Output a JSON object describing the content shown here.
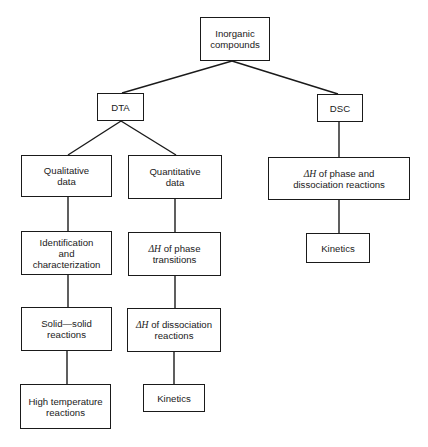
{
  "diagram": {
    "type": "tree",
    "root": {
      "id": "inorganic",
      "label": "Inorganic\ncompounds"
    },
    "nodes": [
      {
        "id": "inorganic",
        "label": "Inorganic\ncompounds",
        "box": [
          200,
          17,
          70,
          44
        ]
      },
      {
        "id": "dta",
        "label": "DTA",
        "box": [
          97,
          93,
          47,
          28
        ]
      },
      {
        "id": "dsc",
        "label": "DSC",
        "box": [
          317,
          94,
          46,
          28
        ]
      },
      {
        "id": "qualitative",
        "label": "Qualitative\ndata",
        "box": [
          21,
          155,
          91,
          42
        ]
      },
      {
        "id": "quantitative",
        "label": "Quantitative\ndata",
        "box": [
          128,
          155,
          94,
          44
        ]
      },
      {
        "id": "dsc_dh",
        "label": "ΔH of phase and\ndissociation reactions",
        "box": [
          268,
          157,
          142,
          43
        ]
      },
      {
        "id": "identification",
        "label": "Identification\nand\ncharacterization",
        "box": [
          21,
          231,
          91,
          44
        ]
      },
      {
        "id": "dh_phase",
        "label": "ΔH of phase\ntransitions",
        "box": [
          128,
          232,
          93,
          44
        ]
      },
      {
        "id": "dsc_kinetics",
        "label": "Kinetics",
        "box": [
          306,
          233,
          64,
          30
        ]
      },
      {
        "id": "solid_solid",
        "label": "Solid—solid\nreactions",
        "box": [
          21,
          307,
          91,
          44
        ]
      },
      {
        "id": "dh_dissociation",
        "label": "ΔH of dissociation\nreactions",
        "box": [
          127,
          308,
          94,
          44
        ]
      },
      {
        "id": "high_temp",
        "label": "High temperature\nreactions",
        "box": [
          20,
          384,
          91,
          45
        ]
      },
      {
        "id": "dta_kinetics",
        "label": "Kinetics",
        "box": [
          143,
          384,
          62,
          28
        ]
      }
    ],
    "edges": [
      {
        "from": "inorganic",
        "to": "dta"
      },
      {
        "from": "inorganic",
        "to": "dsc"
      },
      {
        "from": "dta",
        "to": "qualitative"
      },
      {
        "from": "dta",
        "to": "quantitative"
      },
      {
        "from": "qualitative",
        "to": "identification"
      },
      {
        "from": "identification",
        "to": "solid_solid"
      },
      {
        "from": "solid_solid",
        "to": "high_temp"
      },
      {
        "from": "quantitative",
        "to": "dh_phase"
      },
      {
        "from": "dh_phase",
        "to": "dh_dissociation"
      },
      {
        "from": "dh_dissociation",
        "to": "dta_kinetics"
      },
      {
        "from": "dsc",
        "to": "dsc_dh"
      },
      {
        "from": "dsc_dh",
        "to": "dsc_kinetics"
      }
    ]
  },
  "labels": {
    "inorganic": "Inorganic\ncompounds",
    "dta": "DTA",
    "dsc": "DSC",
    "qualitative": "Qualitative\ndata",
    "quantitative": "Quantitative\ndata",
    "dsc_dh_prefix": "ΔH",
    "dsc_dh_rest": " of phase and\ndissociation reactions",
    "identification": "Identification\nand\ncharacterization",
    "dh_phase_prefix": "ΔH",
    "dh_phase_rest": " of phase\ntransitions",
    "dsc_kinetics": "Kinetics",
    "solid_solid": "Solid—solid\nreactions",
    "dh_dissociation_prefix": "ΔH",
    "dh_dissociation_rest": " of dissociation\nreactions",
    "high_temp": "High temperature\nreactions",
    "dta_kinetics": "Kinetics"
  },
  "colors": {
    "line": "#1a1a1a",
    "background": "#ffffff"
  }
}
